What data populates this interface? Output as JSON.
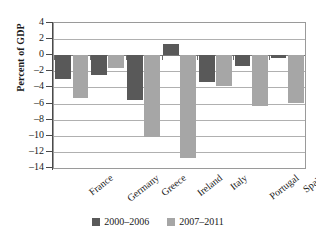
{
  "chart_data": {
    "type": "bar",
    "title": "",
    "xlabel": "",
    "ylabel": "Percent of GDP",
    "ylim": [
      -14,
      4
    ],
    "ytick_step": 2,
    "yticks": [
      4,
      2,
      0,
      -2,
      -4,
      -6,
      -8,
      -10,
      -12,
      -14
    ],
    "ytick_labels": [
      "4",
      "2",
      "0",
      "–2",
      "–4",
      "–6",
      "–8",
      "–10",
      "–12",
      "–14"
    ],
    "grid": true,
    "legend_position": "bottom",
    "categories": [
      "France",
      "Germany",
      "Greece",
      "Ireland",
      "Italy",
      "Portugal",
      "Spain"
    ],
    "series": [
      {
        "name": "2000–2006",
        "color": "#595959",
        "values": [
          -3.0,
          -2.5,
          -5.5,
          1.4,
          -3.3,
          -1.4,
          -0.4
        ]
      },
      {
        "name": "2007–2011",
        "color": "#a6a6a6",
        "values": [
          -5.3,
          -1.6,
          -10.1,
          -12.7,
          -3.8,
          -6.3,
          -5.9
        ]
      }
    ]
  },
  "legend": {
    "items": [
      {
        "label": "2000–2006",
        "swatch": "dark-gray-square"
      },
      {
        "label": "2007–2011",
        "swatch": "light-gray-square"
      }
    ]
  }
}
